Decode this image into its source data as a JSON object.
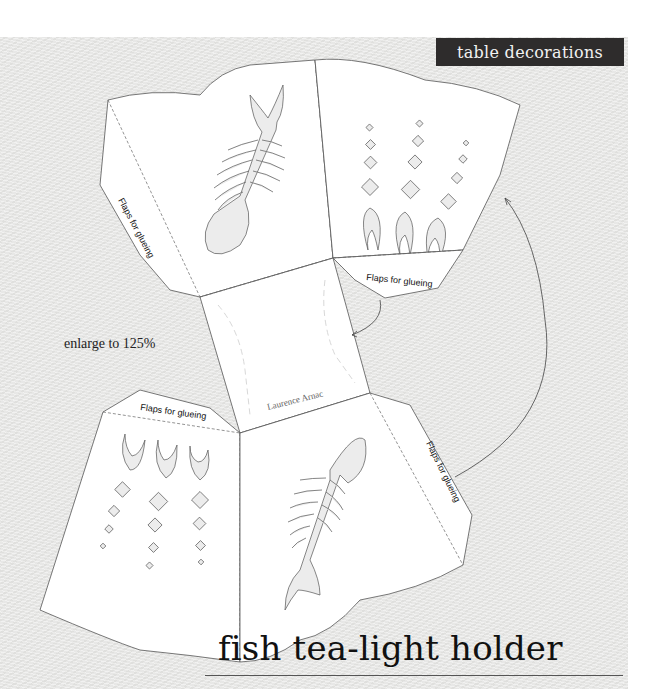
{
  "header": {
    "section_tag": "table decorations"
  },
  "template": {
    "instruction": "enlarge to 125%",
    "flap_labels": [
      "Flaps for glueing",
      "Flaps for glueing",
      "Flaps for glueing",
      "Flaps for glueing"
    ],
    "signature": "Laurence Arnac",
    "panels": [
      {
        "name": "top-left",
        "motif": "fish-skeleton"
      },
      {
        "name": "top-right",
        "motif": "bubbles-and-flames"
      },
      {
        "name": "bottom-left",
        "motif": "bubbles-and-flames"
      },
      {
        "name": "bottom-right",
        "motif": "fish-skeleton"
      }
    ],
    "colors": {
      "paper_background": "#e9e9e7",
      "panel_fill": "#ffffff",
      "outline": "#555555",
      "tag_background": "#2e2c2c"
    }
  },
  "footer": {
    "title": "fish tea-light holder"
  }
}
